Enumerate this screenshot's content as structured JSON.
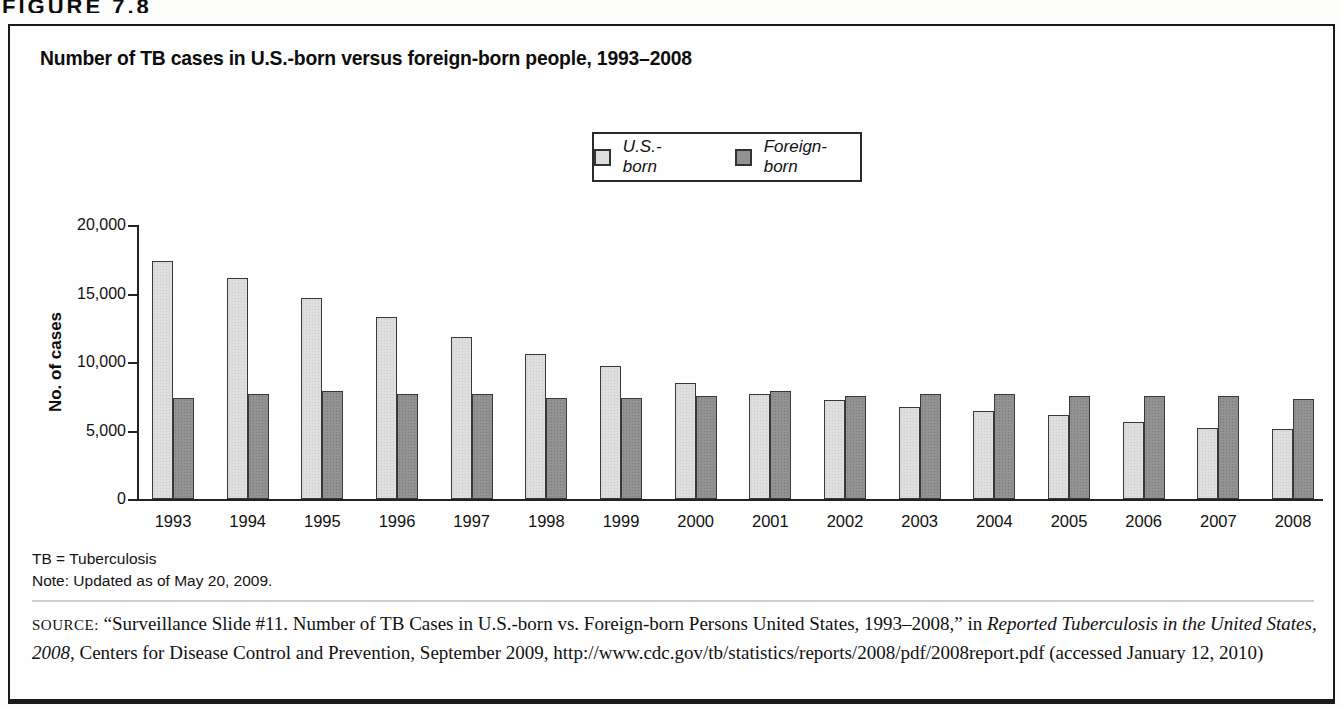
{
  "figure_label": "FIGURE 7.8",
  "chart_data": {
    "type": "bar",
    "title": "Number of TB cases in U.S.-born versus foreign-born people, 1993–2008",
    "xlabel": "",
    "ylabel": "No. of cases",
    "ylim": [
      0,
      20000
    ],
    "ytick_interval": 5000,
    "ytick_labels": [
      "0",
      "5,000",
      "10,000",
      "15,000",
      "20,000"
    ],
    "grid": false,
    "legend_position": "top-center",
    "categories": [
      "1993",
      "1994",
      "1995",
      "1996",
      "1997",
      "1998",
      "1999",
      "2000",
      "2001",
      "2002",
      "2003",
      "2004",
      "2005",
      "2006",
      "2007",
      "2008"
    ],
    "series": [
      {
        "name": "U.S.-born",
        "color": "#dedede",
        "values": [
          17400,
          16100,
          14700,
          13300,
          11800,
          10600,
          9700,
          8500,
          7700,
          7200,
          6700,
          6400,
          6100,
          5600,
          5200,
          5100
        ]
      },
      {
        "name": "Foreign-born",
        "color": "#929292",
        "values": [
          7400,
          7700,
          7900,
          7700,
          7700,
          7400,
          7400,
          7500,
          7900,
          7500,
          7700,
          7700,
          7500,
          7500,
          7500,
          7300
        ]
      }
    ]
  },
  "notes": {
    "abbreviation": "TB = Tuberculosis",
    "update": "Note: Updated as of May 20, 2009."
  },
  "source": {
    "label": "SOURCE:",
    "text_before_italic": " “Surveillance Slide #11. Number of TB Cases in U.S.-born vs. Foreign-born Persons United States, 1993–2008,” in ",
    "italic_text": "Reported Tuberculosis in the United States, 2008",
    "text_after_italic": ", Centers for Disease Control and Prevention, September 2009, http://www.cdc.gov/tb/statistics/reports/2008/pdf/2008report.pdf (accessed January 12, 2010)"
  }
}
